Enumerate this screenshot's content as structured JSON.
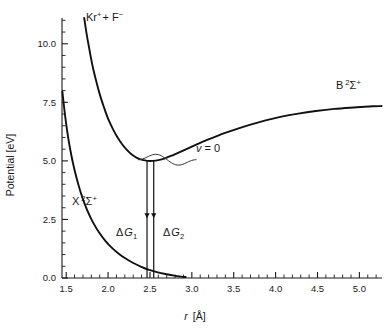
{
  "chart_data": {
    "type": "line",
    "title": "",
    "xlabel": "r [Å]",
    "ylabel": "Potential  [eV]",
    "xlim": [
      1.45,
      5.27
    ],
    "ylim": [
      0.0,
      11.1
    ],
    "grid": false,
    "legend_position": "inline-annotations",
    "x_ticks_major": [
      1.5,
      2.0,
      2.5,
      3.0,
      3.5,
      4.0,
      4.5,
      5.0
    ],
    "x_tick_labels": [
      "1.5",
      "2.0",
      "2.5",
      "3.0",
      "3.5",
      "4.0",
      "4.5",
      "5.0"
    ],
    "x_tick_minor_step": 0.1,
    "y_ticks_major": [
      0.0,
      2.5,
      5.0,
      7.5,
      10.0
    ],
    "y_tick_labels": [
      "0.0",
      "2.5",
      "5.0",
      "7.5",
      "10.0"
    ],
    "y_tick_minor_step": 0.5,
    "series": [
      {
        "name": "B 2Sigma+ (Kr+ + F-)",
        "label": "B ²Σ⁺",
        "points": [
          [
            1.715,
            11.1
          ],
          [
            1.745,
            10.4
          ],
          [
            1.78,
            9.7
          ],
          [
            1.815,
            9.05
          ],
          [
            1.855,
            8.45
          ],
          [
            1.9,
            7.85
          ],
          [
            1.95,
            7.3
          ],
          [
            2.0,
            6.8
          ],
          [
            2.055,
            6.38
          ],
          [
            2.11,
            6.02
          ],
          [
            2.17,
            5.7
          ],
          [
            2.23,
            5.45
          ],
          [
            2.29,
            5.25
          ],
          [
            2.35,
            5.12
          ],
          [
            2.41,
            5.04
          ],
          [
            2.47,
            5.0
          ],
          [
            2.53,
            5.0
          ],
          [
            2.6,
            5.03
          ],
          [
            2.68,
            5.11
          ],
          [
            2.77,
            5.24
          ],
          [
            2.87,
            5.4
          ],
          [
            2.98,
            5.58
          ],
          [
            3.1,
            5.77
          ],
          [
            3.23,
            5.96
          ],
          [
            3.38,
            6.17
          ],
          [
            3.54,
            6.37
          ],
          [
            3.7,
            6.55
          ],
          [
            3.88,
            6.73
          ],
          [
            4.07,
            6.89
          ],
          [
            4.27,
            7.02
          ],
          [
            4.48,
            7.13
          ],
          [
            4.7,
            7.22
          ],
          [
            4.93,
            7.28
          ],
          [
            5.165,
            7.33
          ],
          [
            5.265,
            7.34
          ]
        ]
      },
      {
        "name": "X 2Sigma+ ground state",
        "label": "X ²Σ⁺",
        "points": [
          [
            1.455,
            7.95
          ],
          [
            1.47,
            7.45
          ],
          [
            1.49,
            6.85
          ],
          [
            1.515,
            6.2
          ],
          [
            1.545,
            5.55
          ],
          [
            1.58,
            4.92
          ],
          [
            1.62,
            4.32
          ],
          [
            1.665,
            3.75
          ],
          [
            1.715,
            3.22
          ],
          [
            1.77,
            2.74
          ],
          [
            1.83,
            2.31
          ],
          [
            1.895,
            1.93
          ],
          [
            1.965,
            1.6
          ],
          [
            2.04,
            1.31
          ],
          [
            2.12,
            1.06
          ],
          [
            2.205,
            0.84
          ],
          [
            2.295,
            0.65
          ],
          [
            2.39,
            0.49
          ],
          [
            2.49,
            0.35
          ],
          [
            2.595,
            0.24
          ],
          [
            2.7,
            0.16
          ],
          [
            2.79,
            0.1
          ],
          [
            2.87,
            0.06
          ],
          [
            2.925,
            0.04
          ]
        ]
      }
    ],
    "annotations": [
      {
        "name": "upper-asymptote-label",
        "text": "Kr⁺+ F⁻",
        "x_data": 1.86,
        "y_data": 11.25
      },
      {
        "name": "b-state-label",
        "text": "B ²Σ⁺",
        "x_data": 4.7,
        "y_data": 8.05
      },
      {
        "name": "x-state-label",
        "text": "X ²Σ⁺",
        "x_data": 1.8,
        "y_data": 3.55
      },
      {
        "name": "vibrational-level-label",
        "text": "v = 0",
        "x_data": 2.84,
        "y_data": 5.1
      },
      {
        "name": "delta-g1-label",
        "text": "ΔG₁",
        "x_data": 2.32,
        "y_data": 2.1
      },
      {
        "name": "delta-g2-label",
        "text": "ΔG₂",
        "x_data": 2.6,
        "y_data": 2.1
      }
    ],
    "transitions": [
      {
        "name": "delta-g1-arrow",
        "x_data": 2.465,
        "y_top": 5.02,
        "y_bottom": 0.0,
        "arrowhead_y": 2.55,
        "label": "ΔG₁"
      },
      {
        "name": "delta-g2-arrow",
        "x_data": 2.545,
        "y_top": 5.02,
        "y_bottom": 0.0,
        "arrowhead_y": 2.55,
        "label": "ΔG₂"
      }
    ],
    "wavefunction": {
      "name": "v0-wavefunction",
      "center_y": 5.05,
      "x_start": 2.36,
      "x_end": 3.05,
      "amplitude": 0.3
    },
    "colors": {
      "curve": "#111111",
      "axis": "#1a1a1a",
      "background": "#ffffff"
    }
  },
  "labels": {
    "y_axis_title": "Potential  [eV]",
    "x_axis_title_var": "r",
    "x_axis_title_unit": "[Å]",
    "kr_f_label_main": "Kr",
    "kr_f_label_sup1": "+",
    "kr_f_label_mid": "+ F",
    "kr_f_label_sup2": "−",
    "b_state_main": "B",
    "b_state_sup": "2",
    "b_state_sigma": "Σ",
    "b_state_sup2": "+",
    "x_state_main": "X",
    "x_state_sup": "2",
    "x_state_sigma": "Σ",
    "x_state_sup2": "+",
    "v_label_var": "v",
    "v_label_rest": "= 0",
    "dg1_delta": "Δ",
    "dg1_g": "G",
    "dg1_sub": "1",
    "dg2_delta": "Δ",
    "dg2_g": "G",
    "dg2_sub": "2"
  }
}
